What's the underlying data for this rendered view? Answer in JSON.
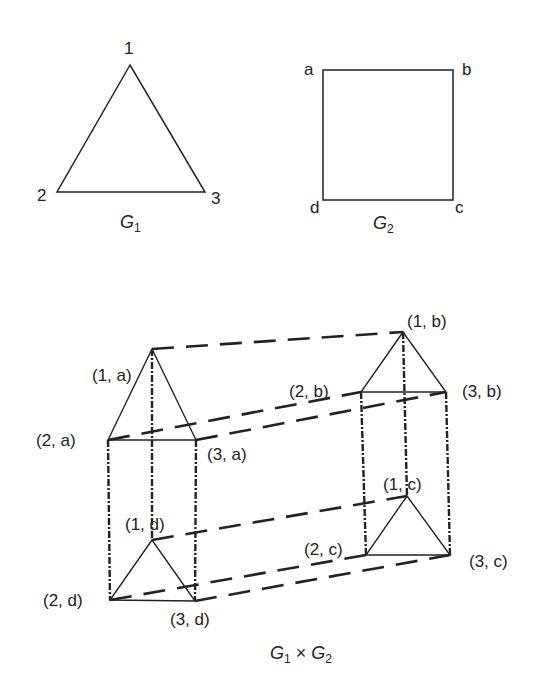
{
  "figure": {
    "background": "#ffffff",
    "stroke_color": "#222222"
  },
  "g1": {
    "caption_base": "G",
    "caption_sub": "1",
    "vertices": [
      {
        "id": "1",
        "label": "1",
        "x": 130,
        "y": 65
      },
      {
        "id": "2",
        "label": "2",
        "x": 57,
        "y": 192
      },
      {
        "id": "3",
        "label": "3",
        "x": 205,
        "y": 192
      }
    ],
    "edges": [
      [
        "1",
        "2"
      ],
      [
        "1",
        "3"
      ],
      [
        "2",
        "3"
      ]
    ]
  },
  "g2": {
    "caption_base": "G",
    "caption_sub": "2",
    "vertices": [
      {
        "id": "a",
        "label": "a",
        "x": 323,
        "y": 70
      },
      {
        "id": "b",
        "label": "b",
        "x": 453,
        "y": 70
      },
      {
        "id": "c",
        "label": "c",
        "x": 453,
        "y": 200
      },
      {
        "id": "d",
        "label": "d",
        "x": 323,
        "y": 200
      }
    ],
    "edges": [
      [
        "a",
        "b"
      ],
      [
        "b",
        "c"
      ],
      [
        "c",
        "d"
      ],
      [
        "d",
        "a"
      ]
    ]
  },
  "product": {
    "caption_left_base": "G",
    "caption_left_sub": "1",
    "caption_operator": "×",
    "caption_right_base": "G",
    "caption_right_sub": "2",
    "vertices": [
      {
        "id": "1a",
        "label": "(1, a)",
        "x": 152,
        "y": 349
      },
      {
        "id": "2a",
        "label": "(2, a)",
        "x": 108,
        "y": 440
      },
      {
        "id": "3a",
        "label": "(3, a)",
        "x": 196,
        "y": 440
      },
      {
        "id": "1b",
        "label": "(1, b)",
        "x": 403,
        "y": 332
      },
      {
        "id": "2b",
        "label": "(2, b)",
        "x": 361,
        "y": 392
      },
      {
        "id": "3b",
        "label": "(3, b)",
        "x": 446,
        "y": 392
      },
      {
        "id": "1c",
        "label": "(1, c)",
        "x": 407,
        "y": 496
      },
      {
        "id": "2c",
        "label": "(2, c)",
        "x": 366,
        "y": 555
      },
      {
        "id": "3c",
        "label": "(3, c)",
        "x": 450,
        "y": 555
      },
      {
        "id": "1d",
        "label": "(1, d)",
        "x": 152,
        "y": 540
      },
      {
        "id": "2d",
        "label": "(2, d)",
        "x": 110,
        "y": 600
      },
      {
        "id": "3d",
        "label": "(3, d)",
        "x": 195,
        "y": 601
      }
    ],
    "solid_edges_note": "triangle copies of G1 at each G2 vertex",
    "dashed_edges_note": "copies of G2 edges: a–b and d–c long dashes, a–d and b–c dotted verticals"
  }
}
